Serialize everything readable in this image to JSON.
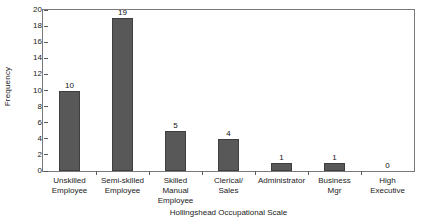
{
  "chart_data": {
    "type": "bar",
    "title": "",
    "xlabel": "Hollingshead Occupational Scale",
    "ylabel": "Frequency",
    "categories": [
      "Unskilled Employee",
      "Semi-skilled Employee",
      "Skilled Manual Employee",
      "Clerical/ Sales",
      "Administrator",
      "Business Mgr",
      "High Executive"
    ],
    "category_lines": [
      [
        "Unskilled",
        "Employee"
      ],
      [
        "Semi-skilled",
        "Employee"
      ],
      [
        "Skilled",
        "Manual",
        "Employee"
      ],
      [
        "Clerical/",
        "Sales"
      ],
      [
        "Administrator"
      ],
      [
        "Business",
        "Mgr"
      ],
      [
        "High",
        "Executive"
      ]
    ],
    "values": [
      10,
      19,
      5,
      4,
      1,
      1,
      0
    ],
    "value_labels": [
      "10",
      "19",
      "5",
      "4",
      "1",
      "1",
      "0"
    ],
    "ylim": [
      0,
      20
    ],
    "ytick_values": [
      0,
      2,
      4,
      6,
      8,
      10,
      12,
      14,
      16,
      18,
      20
    ],
    "ytick_labels": [
      "0",
      "2",
      "4",
      "6",
      "8",
      "10",
      "12",
      "14",
      "16",
      "18",
      "20"
    ],
    "grid": false,
    "legend": false,
    "bar_color": "#585858",
    "bar_edge_color": "#3f3f3f",
    "frame_color": "#7a7a7a",
    "text_color": "#222222"
  }
}
